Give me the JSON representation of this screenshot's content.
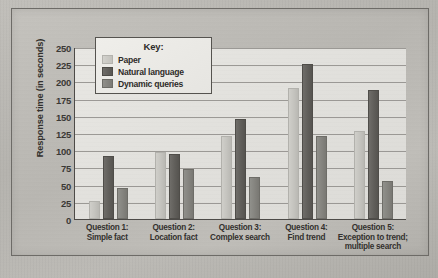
{
  "figure": {
    "y_axis_title": "Response time (in seconds)",
    "y_ticks": [
      "250",
      "225",
      "200",
      "175",
      "150",
      "125",
      "100",
      "75",
      "50",
      "25",
      "0"
    ]
  },
  "legend": {
    "title": "Key:",
    "entries": [
      {
        "label": "Paper",
        "color": "#c6c5c0"
      },
      {
        "label": "Natural language",
        "color": "#5d5b57"
      },
      {
        "label": "Dynamic queries",
        "color": "#84837e"
      }
    ]
  },
  "categories_display": [
    {
      "line1": "Question 1:",
      "line2": "Simple fact",
      "line3": ""
    },
    {
      "line1": "Question 2:",
      "line2": "Location fact",
      "line3": ""
    },
    {
      "line1": "Question 3:",
      "line2": "Complex search",
      "line3": ""
    },
    {
      "line1": "Question 4:",
      "line2": "Find trend",
      "line3": ""
    },
    {
      "line1": "Question 5:",
      "line2": "Exception to trend;",
      "line3": "multiple search"
    }
  ],
  "chart_data": {
    "type": "bar",
    "title": "",
    "xlabel": "",
    "ylabel": "Response time (in seconds)",
    "ylim": [
      0,
      250
    ],
    "ytick_step": 25,
    "grid": true,
    "legend_position": "top-left-inside",
    "categories": [
      "Question 1: Simple fact",
      "Question 2: Location fact",
      "Question 3: Complex search",
      "Question 4: Find trend",
      "Question 5: Exception to trend; multiple search"
    ],
    "series": [
      {
        "name": "Paper",
        "values": [
          26,
          98,
          121,
          190,
          128
        ]
      },
      {
        "name": "Natural language",
        "values": [
          91,
          94,
          145,
          226,
          188
        ]
      },
      {
        "name": "Dynamic queries",
        "values": [
          45,
          72,
          61,
          120,
          55
        ]
      }
    ]
  }
}
